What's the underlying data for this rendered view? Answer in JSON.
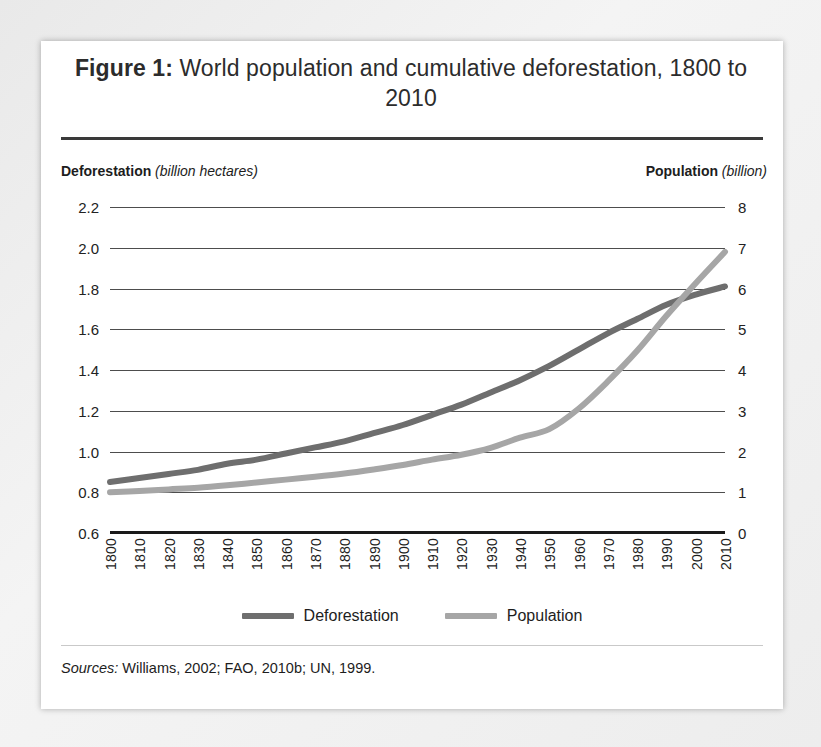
{
  "figure": {
    "label": "Figure 1:",
    "title_text": " World population and cumulative deforestation, 1800 to 2010",
    "source_label": "Sources:",
    "source_text": " Williams, 2002; FAO, 2010b; UN, 1999."
  },
  "axes": {
    "left_caption_bold": "Deforestation",
    "left_caption_italic": " (billion hectares)",
    "right_caption_bold": "Population",
    "right_caption_italic": " (billion)"
  },
  "legend": {
    "items": [
      {
        "label": "Deforestation",
        "color": "#6e6e6e"
      },
      {
        "label": "Population",
        "color": "#a6a6a6"
      }
    ]
  },
  "chart_data": {
    "type": "line",
    "title": "Figure 1: World population and cumulative deforestation, 1800 to 2010",
    "xlabel": "",
    "grid": true,
    "legend_position": "bottom",
    "x": [
      1800,
      1810,
      1820,
      1830,
      1840,
      1850,
      1860,
      1870,
      1880,
      1890,
      1900,
      1910,
      1920,
      1930,
      1940,
      1950,
      1960,
      1970,
      1980,
      1990,
      2000,
      2010
    ],
    "xtick_labels": [
      "1800",
      "1810",
      "1820",
      "1830",
      "1840",
      "1850",
      "1860",
      "1870",
      "1880",
      "1890",
      "1900",
      "1910",
      "1920",
      "1930",
      "1940",
      "1950",
      "1960",
      "1970",
      "1980",
      "1990",
      "2000",
      "2010"
    ],
    "left_axis": {
      "label": "Deforestation (billion hectares)",
      "ylim": [
        0.6,
        2.2
      ],
      "ticks": [
        0.6,
        0.8,
        1.0,
        1.2,
        1.4,
        1.6,
        1.8,
        2.0,
        2.2
      ],
      "tick_labels": [
        "0.6",
        "0.8",
        "1.0",
        "1.2",
        "1.4",
        "1.6",
        "1.8",
        "2.0",
        "2.2"
      ]
    },
    "right_axis": {
      "label": "Population (billion)",
      "ylim": [
        0,
        8
      ],
      "ticks": [
        0,
        1,
        2,
        3,
        4,
        5,
        6,
        7,
        8
      ],
      "tick_labels": [
        "0",
        "1",
        "2",
        "3",
        "4",
        "5",
        "6",
        "7",
        "8"
      ]
    },
    "series": [
      {
        "name": "Deforestation",
        "axis": "left",
        "units": "billion hectares",
        "color": "#6e6e6e",
        "values": [
          0.85,
          0.87,
          0.89,
          0.91,
          0.94,
          0.96,
          0.99,
          1.02,
          1.05,
          1.09,
          1.13,
          1.18,
          1.23,
          1.29,
          1.35,
          1.42,
          1.5,
          1.58,
          1.65,
          1.72,
          1.77,
          1.81
        ]
      },
      {
        "name": "Population",
        "axis": "right",
        "units": "billion",
        "color": "#a6a6a6",
        "values": [
          1.0,
          1.03,
          1.07,
          1.11,
          1.17,
          1.24,
          1.31,
          1.38,
          1.46,
          1.56,
          1.67,
          1.8,
          1.92,
          2.09,
          2.34,
          2.55,
          3.05,
          3.72,
          4.47,
          5.33,
          6.13,
          6.9
        ]
      }
    ]
  }
}
